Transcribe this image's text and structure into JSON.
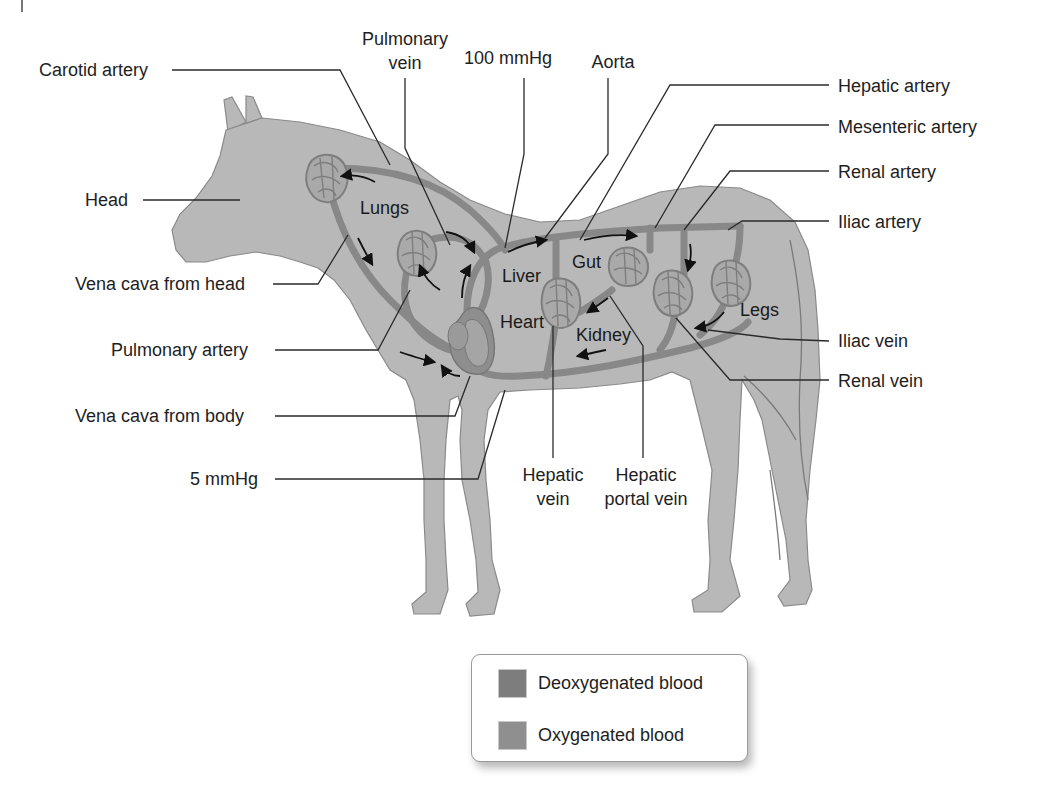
{
  "figure": {
    "colors": {
      "background": "#ffffff",
      "horse_body": "#b8b8b8",
      "vessel": "#888888",
      "deoxygenated": "#7d7d7d",
      "oxygenated": "#8f8f8f",
      "text": "#1e1e1e"
    }
  },
  "labels": {
    "left": {
      "carotid_artery": "Carotid artery",
      "head": "Head",
      "vena_cava_head": "Vena cava from head",
      "pulmonary_artery": "Pulmonary artery",
      "vena_cava_body": "Vena cava from body",
      "pressure_low": "5 mmHg"
    },
    "top": {
      "pulmonary_vein_line1": "Pulmonary",
      "pulmonary_vein_line2": "vein",
      "pressure_high": "100 mmHg",
      "aorta": "Aorta"
    },
    "right": {
      "hepatic_artery": "Hepatic artery",
      "mesenteric_artery": "Mesenteric artery",
      "renal_artery": "Renal artery",
      "iliac_artery": "Iliac artery",
      "iliac_vein": "Iliac vein",
      "renal_vein": "Renal vein"
    },
    "bottom": {
      "hepatic_vein_line1": "Hepatic",
      "hepatic_vein_line2": "vein",
      "hepatic_portal_vein_line1": "Hepatic",
      "hepatic_portal_vein_line2": "portal vein"
    },
    "organs": {
      "lungs": "Lungs",
      "liver": "Liver",
      "gut": "Gut",
      "heart": "Heart",
      "kidney": "Kidney",
      "legs": "Legs"
    }
  },
  "legend": {
    "items": [
      {
        "label": "Deoxygenated blood",
        "color": "#7d7d7d"
      },
      {
        "label": "Oxygenated blood",
        "color": "#8f8f8f"
      }
    ]
  }
}
